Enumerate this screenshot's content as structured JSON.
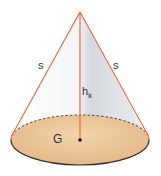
{
  "diagram": {
    "labels": {
      "slant_left": "s",
      "slant_right": "s",
      "height": "h",
      "height_sub": "k",
      "base": "G"
    },
    "colors": {
      "background": "#ffffff",
      "edge": "#e8643c",
      "base_fill": "#ecc79a",
      "base_outline": "#3a2e24",
      "surface_light": "#ffffff",
      "surface_shade": "#d9dde2",
      "label": "#2a3340",
      "center_dot": "#111111"
    },
    "geometry": {
      "apex": [
        80,
        12
      ],
      "base_center": [
        80,
        140
      ],
      "base_rx": 69,
      "base_ry": 25
    }
  }
}
